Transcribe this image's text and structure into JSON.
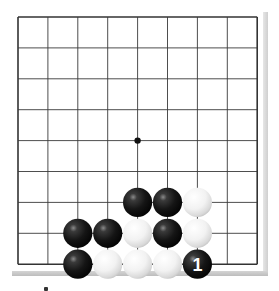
{
  "board": {
    "size_lines": 9,
    "origin": {
      "x": 18,
      "y": 17
    },
    "spacing": {
      "x": 29.9,
      "y": 30.9
    },
    "line_color": "#3a3a3a",
    "border_color": "#333333",
    "background": "#ffffff",
    "star_points": [
      {
        "col": 4,
        "row": 4
      }
    ],
    "stones": [
      {
        "color": "black",
        "col": 4,
        "row": 6
      },
      {
        "color": "black",
        "col": 5,
        "row": 6
      },
      {
        "color": "white",
        "col": 6,
        "row": 6
      },
      {
        "color": "black",
        "col": 2,
        "row": 7
      },
      {
        "color": "black",
        "col": 3,
        "row": 7
      },
      {
        "color": "white",
        "col": 4,
        "row": 7
      },
      {
        "color": "black",
        "col": 5,
        "row": 7
      },
      {
        "color": "white",
        "col": 6,
        "row": 7
      },
      {
        "color": "black",
        "col": 2,
        "row": 8
      },
      {
        "color": "white",
        "col": 3,
        "row": 8
      },
      {
        "color": "white",
        "col": 4,
        "row": 8
      },
      {
        "color": "white",
        "col": 5,
        "row": 8
      },
      {
        "color": "black",
        "col": 6,
        "row": 8,
        "label": "1"
      }
    ]
  },
  "move_label": "1"
}
